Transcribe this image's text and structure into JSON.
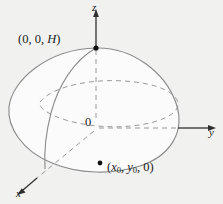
{
  "figure": {
    "kind": "3d-coordinate-diagram",
    "background_color": "#f1f1f0",
    "outline_color": "#8a8a8a",
    "dashed_color": "#9a9a9a",
    "axis_color": "#2a2a2a",
    "fill_color": "#fbfbfb",
    "axes": [
      {
        "name": "z-axis",
        "label": "z",
        "label_x": 92,
        "label_y": 2
      },
      {
        "name": "y-axis",
        "label": "y",
        "label_x": 209,
        "label_y": 127
      },
      {
        "name": "x-axis",
        "label": "x",
        "label_x": 16,
        "label_y": 188
      }
    ],
    "origin": {
      "label": "0",
      "x": 85,
      "y": 116
    },
    "points": [
      {
        "name": "apex-point",
        "label_prefix": "(0, 0, ",
        "label_italic": "H",
        "label_suffix": ")",
        "dot_x": 96,
        "dot_y": 48,
        "label_x": 18,
        "label_y": 33
      },
      {
        "name": "base-point",
        "label_open": "(",
        "label_x_var": "x",
        "label_x_sub": "0",
        "label_sep1": ", ",
        "label_y_var": "y",
        "label_y_sub": "0",
        "label_sep2": ", 0)",
        "dot_x": 100,
        "dot_y": 163,
        "label_x": 107,
        "label_y": 161
      }
    ]
  }
}
